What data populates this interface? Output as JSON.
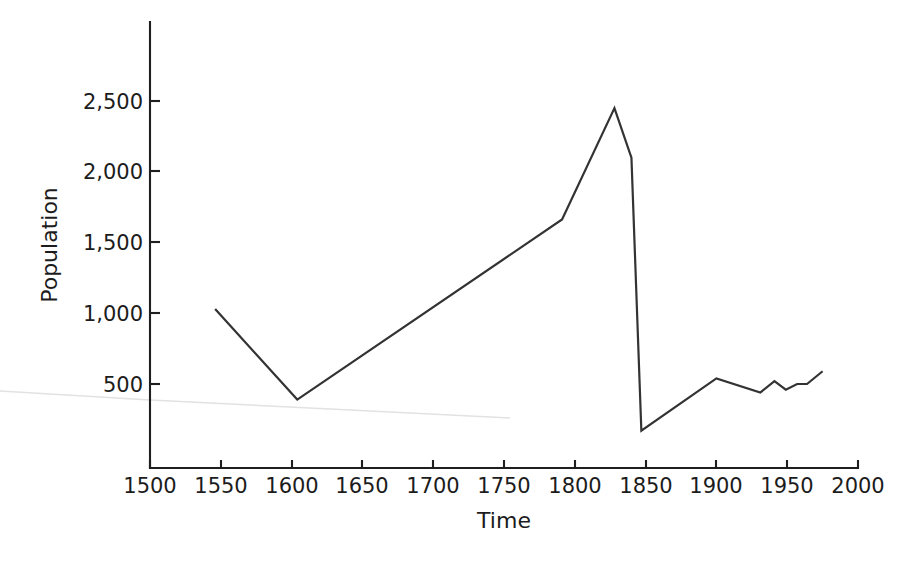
{
  "chart_data": {
    "type": "line",
    "title": "",
    "subtitle": "",
    "xlabel": "Time",
    "ylabel": "Population",
    "xlim": [
      1500,
      2000
    ],
    "ylim": [
      0,
      2700
    ],
    "xticks": [
      1500,
      1550,
      1600,
      1650,
      1700,
      1750,
      1800,
      1850,
      1900,
      1950,
      2000
    ],
    "xtick_labels": [
      "1500",
      "1550",
      "1600",
      "1650",
      "1700",
      "1750",
      "1800",
      "1850",
      "1900",
      "1950",
      "2000"
    ],
    "yticks": [
      500,
      1000,
      1500,
      2000,
      2500
    ],
    "ytick_labels": [
      "500",
      "1,000",
      "1,500",
      "2,000",
      "2,500"
    ],
    "grid": false,
    "legend": null,
    "legend_position": "none",
    "annotations": [],
    "series": [
      {
        "name": "Population",
        "color": "#333333",
        "x": [
          1546,
          1604,
          1791,
          1828,
          1840,
          1847,
          1900,
          1931,
          1941,
          1949,
          1957,
          1964,
          1975
        ],
        "values": [
          1030,
          390,
          1663,
          2450,
          2100,
          170,
          540,
          440,
          520,
          460,
          500,
          500,
          590
        ]
      }
    ]
  },
  "axes": {
    "y_label": "Population",
    "x_label": "Time",
    "y_tick_values": [
      "2,500",
      "2,000",
      "1,500",
      "1,000",
      "500"
    ],
    "x_tick_values": [
      "1500",
      "1550",
      "1600",
      "1650",
      "1700",
      "1750",
      "1800",
      "1850",
      "1900",
      "1950",
      "2000"
    ]
  },
  "colors": {
    "line": "#333333",
    "axis": "#1f1f1f",
    "text": "#1c1c1c",
    "background": "#ffffff",
    "artifact": "#e2e2e4"
  },
  "artifact": {
    "name": "scan-crease-line",
    "description": "faint diagonal page-crease line across lower left"
  }
}
